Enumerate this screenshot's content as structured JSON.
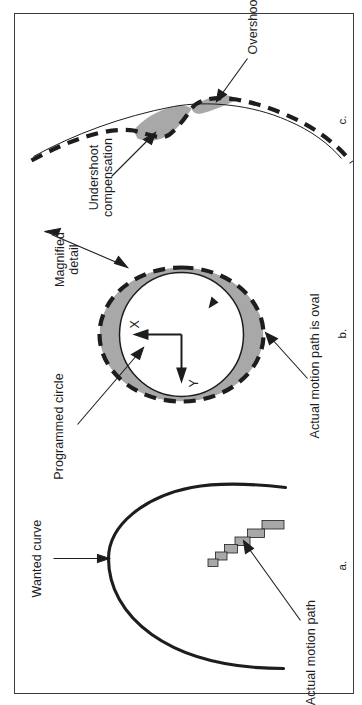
{
  "figure": {
    "kind": "technical-diagram",
    "orientation": "rotated-90-ccw",
    "border_color": "#3a3a3c",
    "background_color": "#ffffff",
    "shade_fill": "#a8a8a8",
    "line_color": "#1d1d1f"
  },
  "panels": [
    {
      "id": "a",
      "letter": "a.",
      "caption_labels": [
        {
          "name": "wanted-curve",
          "text": "Wanted curve"
        },
        {
          "name": "actual-motion-path",
          "text": "Actual motion path"
        }
      ],
      "description": "Smooth wanted arc versus a stair-stepped actual motion path"
    },
    {
      "id": "b",
      "letter": "b.",
      "caption_labels": [
        {
          "name": "programmed-circle",
          "text": "Programmed circle"
        },
        {
          "name": "actual-motion-path-is-oval",
          "text": "Actual motion path is oval"
        },
        {
          "name": "magnified-detail",
          "text_line1": "Magnified",
          "text_line2": "detail"
        }
      ],
      "axes": [
        {
          "name": "x-axis",
          "text": "X"
        },
        {
          "name": "y-axis",
          "text": "Y"
        }
      ],
      "description": "Solid programmed circle inside a dashed oval actual path, shaded deviation between them"
    },
    {
      "id": "c",
      "letter": "c.",
      "caption_labels": [
        {
          "name": "undershoot-compensation",
          "text_line1": "Undershoot",
          "text_line2": "compensation"
        },
        {
          "name": "overshoot",
          "text": "Overshoot"
        }
      ],
      "description": "Magnified quadrant-transition detail showing shaded overshoot and undershoot compensation regions"
    }
  ]
}
